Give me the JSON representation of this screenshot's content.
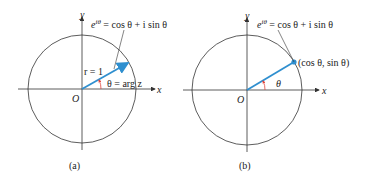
{
  "panels": [
    {
      "id": "a",
      "caption": "(a)",
      "x_label": "x",
      "y_label": "y",
      "origin_label": "O",
      "formula": "e^{iθ} = cos θ + i sin θ",
      "formula_base": "e",
      "formula_sup": "iθ",
      "formula_rest": " = cos θ + i sin θ",
      "radius_label": "r = 1",
      "angle_label": "θ = arg z"
    },
    {
      "id": "b",
      "caption": "(b)",
      "x_label": "x",
      "y_label": "y",
      "origin_label": "O",
      "formula": "e^{iθ} = cos θ + i sin θ",
      "formula_base": "e",
      "formula_sup": "iθ",
      "formula_rest": " = cos θ + i sin θ",
      "point_label": "(cos θ, sin θ)",
      "angle_label": "θ"
    }
  ],
  "colors": {
    "vector": "#2f8fcf",
    "angle_arc": "#e0443a",
    "axes": "#333333",
    "circle": "#333333"
  }
}
